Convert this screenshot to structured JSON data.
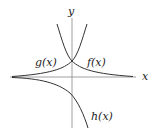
{
  "diagram": {
    "type": "function-graph",
    "axes": {
      "x_label": "x",
      "y_label": "y"
    },
    "curves": [
      {
        "name": "f",
        "label": "f(x)",
        "description": "decaying exponential through (0,1), tends to 0 as x→+∞"
      },
      {
        "name": "g",
        "label": "g(x)",
        "description": "growing exponential through (0,1), tends to 0 as x→−∞"
      },
      {
        "name": "h",
        "label": "h(x)",
        "description": "negative growing exponential, -e^x, tends to 0 from below as x→−∞"
      }
    ],
    "colors": {
      "curve": "#333333",
      "axis": "#777777",
      "text": "#222222"
    }
  }
}
